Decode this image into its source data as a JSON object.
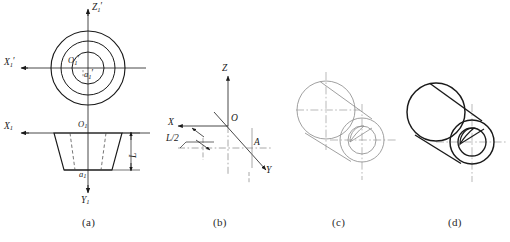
{
  "figure": {
    "panel_count": 4
  },
  "captions": [
    {
      "key": "a",
      "text": "(a)"
    },
    {
      "key": "b",
      "text": "(b)"
    },
    {
      "key": "c",
      "text": "(c)"
    },
    {
      "key": "d",
      "text": "(d)"
    }
  ],
  "panel_a": {
    "name": "orthographic-projections",
    "front_view": {
      "axis_z_label": "Z",
      "axis_z_sub": "1",
      "axis_z_prime": "′",
      "axis_x_label": "X",
      "axis_x_sub": "1",
      "axis_x_prime": "′",
      "center_label": "O",
      "center_sub": "1",
      "center_prime": "′",
      "point_label": "a",
      "point_sub": "1",
      "point_prime": "′",
      "circle_count": 3
    },
    "top_view": {
      "axis_x_label": "X",
      "axis_x_sub": "1",
      "axis_y_label": "Y",
      "axis_y_sub": "1",
      "origin_label": "O",
      "origin_sub": "1",
      "point_label": "a",
      "point_sub": "1",
      "dimension_label": "L"
    }
  },
  "panel_b": {
    "name": "axonometric-axes",
    "axis_z_label": "Z",
    "axis_x_label": "X",
    "axis_y_label": "Y",
    "origin_label": "O",
    "point_label": "A",
    "dimension_label": "L/2"
  },
  "panel_c": {
    "name": "construction-lines",
    "description": "light construction geometry with centrelines"
  },
  "panel_d": {
    "name": "finished-solid",
    "description": "heavy outline finished axonometric solid"
  },
  "colors": {
    "outline": "#1a1a1a",
    "construction": "#8f8f8f",
    "centerline": "#7a7a7a",
    "background": "#ffffff"
  }
}
